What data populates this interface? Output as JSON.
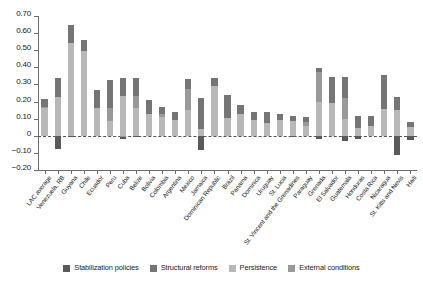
{
  "chart_data": {
    "type": "bar",
    "stacked": true,
    "title": "",
    "xlabel": "",
    "ylabel": "",
    "ylim": [
      -0.2,
      0.7
    ],
    "yticks": [
      0.7,
      0.6,
      0.5,
      0.4,
      0.3,
      0.2,
      0.1,
      0,
      -0.1,
      -0.2
    ],
    "ytick_labels": [
      "0.70",
      "0.60",
      "0.50",
      "0.40",
      "0.30",
      "0.20",
      "0.10",
      "0",
      "−0.10",
      "−0.20"
    ],
    "grid": false,
    "zero_line": true,
    "legend_position": "bottom",
    "categories": [
      "LAC average",
      "Venezuela, RB",
      "Guyana",
      "Chile",
      "Ecuador",
      "Peru",
      "Cuba",
      "Belize",
      "Bolivia",
      "Colombia",
      "Argentina",
      "Mexico",
      "Jamaica",
      "Dominican Republic",
      "Brazil",
      "Panama",
      "Dominica",
      "Uruguay",
      "St. Lucia",
      "St. Vincent and the Grenadines",
      "Paraguay",
      "Grenada",
      "El Salvador",
      "Guatemala",
      "Honduras",
      "Costa Rica",
      "Nicaragua",
      "St. Kitts and Nevis",
      "Haiti"
    ],
    "series": [
      {
        "name": "Stabilization policies",
        "color": "#5a5a5a",
        "values": [
          0.0,
          -0.075,
          -0.01,
          0.0,
          0.0,
          0.0,
          -0.01,
          -0.01,
          0.0,
          0.0,
          0.0,
          0.0,
          -0.085,
          0.0,
          0.0,
          0.0,
          0.0,
          0.0,
          0.0,
          -0.01,
          0.0,
          -0.02,
          0.0,
          -0.03,
          -0.02,
          0.0,
          0.0,
          -0.11,
          -0.025
        ]
      },
      {
        "name": "Structural reforms",
        "color": "#757575",
        "values": [
          0.045,
          0.11,
          0.105,
          0.065,
          0.11,
          0.16,
          0.11,
          0.11,
          0.08,
          0.045,
          0.05,
          0.055,
          0.18,
          0.045,
          0.135,
          0.055,
          0.045,
          0.065,
          0.04,
          0.03,
          0.03,
          0.025,
          0.155,
          0.125,
          0.07,
          0.06,
          0.2,
          0.075,
          0.03
        ]
      },
      {
        "name": "Persistence",
        "color": "#b8b8b8",
        "values": [
          0.165,
          0.225,
          0.54,
          0.495,
          0.16,
          0.085,
          0.23,
          0.16,
          0.13,
          0.11,
          0.09,
          0.15,
          0.04,
          0.29,
          0.105,
          0.125,
          0.095,
          0.075,
          0.09,
          0.085,
          0.06,
          0.195,
          0.19,
          0.1,
          0.045,
          0.055,
          0.155,
          0.15,
          0.05
        ]
      },
      {
        "name": "External conditions",
        "color": "#999999",
        "values": [
          0.005,
          0.0,
          0.0,
          0.0,
          0.0,
          0.08,
          -0.01,
          0.07,
          0.0,
          0.015,
          0.0,
          0.125,
          0.0,
          0.0,
          0.0,
          0.0,
          0.0,
          0.0,
          0.0,
          0.0,
          0.02,
          0.175,
          0.0,
          0.12,
          0.0,
          0.0,
          0.0,
          0.0,
          0.0
        ]
      }
    ],
    "totals": [
      0.215,
      0.335,
      0.645,
      0.56,
      0.27,
      0.325,
      0.33,
      0.34,
      0.21,
      0.17,
      0.14,
      0.33,
      0.22,
      0.335,
      0.24,
      0.18,
      0.14,
      0.14,
      0.13,
      0.115,
      0.11,
      0.395,
      0.345,
      0.345,
      0.115,
      0.115,
      0.355,
      0.335,
      0.08
    ]
  },
  "legend": {
    "items": [
      {
        "label": "Stabilization policies",
        "color": "#5a5a5a"
      },
      {
        "label": "Structural reforms",
        "color": "#757575"
      },
      {
        "label": "Persistence",
        "color": "#b8b8b8"
      },
      {
        "label": "External conditions",
        "color": "#999999"
      }
    ]
  }
}
